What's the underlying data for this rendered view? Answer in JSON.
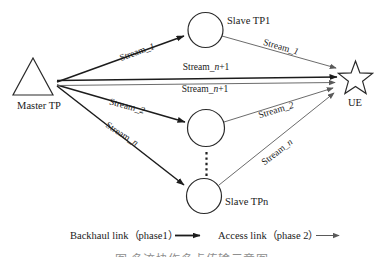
{
  "diagram": {
    "nodes": {
      "master_tp": {
        "label": "Master TP",
        "shape": "triangle"
      },
      "slave_tp1": {
        "label": "Slave TP1",
        "shape": "circle"
      },
      "slave_tp_mid": {
        "label": "",
        "shape": "circle"
      },
      "slave_tpn": {
        "label": "Slave TPn",
        "shape": "circle"
      },
      "ue": {
        "label": "UE",
        "shape": "star"
      }
    },
    "streams": {
      "prefix": "Stream_",
      "one": "1",
      "two": "2",
      "n": "n",
      "plus_one": "+1"
    },
    "links": [
      {
        "from": "Master TP",
        "to": "Slave TP1",
        "type": "backhaul",
        "label": "Stream_1"
      },
      {
        "from": "Master TP",
        "to": "UE",
        "type": "backhaul",
        "label": "Stream_n+1"
      },
      {
        "from": "Master TP",
        "to": "UE",
        "type": "access",
        "label": "Stream_n+1"
      },
      {
        "from": "Master TP",
        "to": "Slave TP (middle)",
        "type": "backhaul",
        "label": "Stream_2"
      },
      {
        "from": "Master TP",
        "to": "Slave TPn",
        "type": "backhaul",
        "label": "Stream_n"
      },
      {
        "from": "Slave TP1",
        "to": "UE",
        "type": "access",
        "label": "Stream_1"
      },
      {
        "from": "Slave TP (middle)",
        "to": "UE",
        "type": "access",
        "label": "Stream_2"
      },
      {
        "from": "Slave TPn",
        "to": "UE",
        "type": "access",
        "label": "Stream_n"
      }
    ],
    "legend": {
      "backhaul": "Backhaul link（phase1）",
      "access": "Access link（phase 2）"
    },
    "caption": "图 多流协作多点传输示意图",
    "colors": {
      "backhaul_line": "#1c1c1c",
      "access_line": "#5a5a5a",
      "text": "#1a1a1a",
      "background": "#ffffff"
    }
  }
}
